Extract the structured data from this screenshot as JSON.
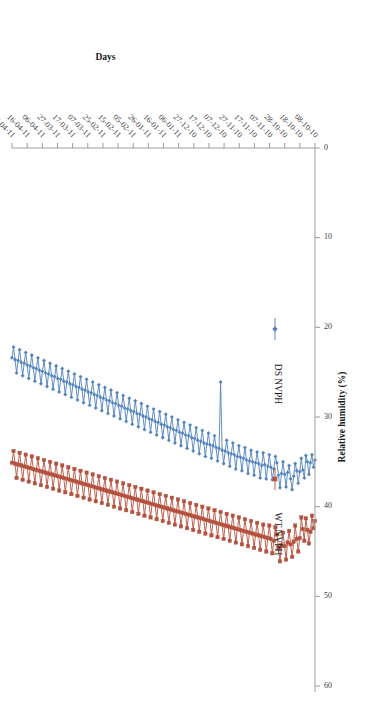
{
  "figure": {
    "orientation_degrees": 180,
    "background_color": "#ffffff"
  },
  "legend": {
    "position": "upper-left",
    "items": [
      {
        "label": "DS NVPH",
        "color": "#4f81bd",
        "marker": "diamond"
      },
      {
        "label": "WT NVPH",
        "color": "#b4503c",
        "marker": "square"
      }
    ]
  },
  "axes": {
    "x": {
      "title": "Days",
      "tick_label_rotation_degrees": 45
    },
    "y": {
      "title": "Relative humidity (%)",
      "ticks": [
        0,
        10,
        20,
        30,
        40,
        50,
        60
      ],
      "min": 0,
      "max": 60
    }
  },
  "chart_data": {
    "type": "line",
    "title": "",
    "xlabel": "Days",
    "ylabel": "Relative humidity (%)",
    "ylim": [
      0,
      60
    ],
    "grid": false,
    "legend_position": "upper-left",
    "tick_labels": [
      "08-10-10",
      "18-10-10",
      "28-10-10",
      "07-11-10",
      "17-11-10",
      "27-11-10",
      "07-12-10",
      "17-12-10",
      "27-12-10",
      "06-01-11",
      "16-01-11",
      "26-01-11",
      "05-02-11",
      "15-02-11",
      "25-02-11",
      "07-03-11",
      "17-03-11",
      "27-03-11",
      "06-04-11",
      "16-04-11",
      "26-04-11"
    ],
    "tick_interval_days": 10,
    "series": [
      {
        "name": "DS NVPH",
        "color": "#4f81bd",
        "marker": "diamond",
        "values": [
          34.8,
          35.6,
          34.2,
          35.1,
          36.4,
          35.0,
          34.3,
          36.8,
          35.9,
          34.6,
          36.1,
          37.4,
          36.0,
          35.2,
          36.6,
          38.1,
          36.9,
          35.4,
          36.2,
          37.8,
          36.4,
          35.0,
          36.3,
          37.9,
          36.5,
          35.1,
          34.4,
          35.8,
          37.0,
          35.6,
          34.2,
          35.5,
          36.9,
          35.3,
          34.0,
          35.4,
          36.8,
          35.2,
          33.9,
          35.1,
          36.5,
          35.0,
          33.7,
          34.9,
          36.3,
          34.8,
          33.4,
          34.6,
          36.0,
          34.5,
          33.2,
          34.4,
          35.8,
          34.2,
          32.9,
          34.1,
          35.5,
          34.0,
          32.6,
          33.8,
          35.2,
          33.7,
          26.1,
          33.5,
          34.9,
          33.4,
          32.1,
          33.2,
          34.6,
          33.1,
          31.8,
          33.0,
          34.4,
          32.9,
          31.5,
          32.7,
          34.1,
          32.6,
          31.2,
          32.4,
          33.8,
          32.3,
          30.9,
          32.1,
          33.5,
          32.0,
          30.6,
          31.8,
          33.2,
          31.7,
          30.3,
          31.5,
          32.9,
          31.4,
          30.0,
          31.2,
          32.6,
          31.1,
          29.7,
          30.9,
          32.3,
          30.8,
          29.4,
          30.6,
          32.0,
          30.5,
          29.1,
          30.3,
          31.7,
          30.2,
          28.8,
          30.0,
          31.4,
          29.9,
          28.5,
          29.7,
          31.1,
          29.6,
          28.2,
          29.4,
          30.8,
          29.3,
          27.9,
          29.1,
          30.5,
          29.0,
          27.6,
          28.8,
          30.2,
          28.7,
          27.3,
          28.5,
          29.9,
          28.4,
          27.0,
          28.2,
          29.6,
          28.1,
          26.7,
          27.9,
          29.3,
          27.8,
          26.4,
          27.6,
          29.0,
          27.5,
          26.1,
          27.3,
          28.7,
          27.2,
          25.8,
          27.0,
          28.4,
          26.9,
          25.5,
          26.7,
          28.1,
          26.6,
          25.2,
          26.4,
          27.8,
          26.3,
          24.9,
          26.1,
          27.5,
          26.0,
          24.6,
          25.8,
          27.2,
          25.7,
          24.3,
          25.5,
          26.9,
          25.4,
          24.0,
          25.2,
          26.6,
          25.1,
          23.7,
          24.9,
          26.3,
          24.8,
          23.4,
          24.6,
          26.0,
          24.5,
          23.1,
          24.3,
          25.7,
          24.2,
          22.8,
          24.0,
          25.4,
          23.9,
          22.5,
          23.7,
          25.1,
          23.6,
          22.2,
          23.4
        ]
      },
      {
        "name": "WT NVPH",
        "color": "#b4503c",
        "marker": "square",
        "values": [
          41.6,
          42.4,
          41.0,
          42.8,
          44.1,
          42.6,
          41.3,
          43.8,
          42.5,
          41.2,
          43.5,
          45.0,
          43.6,
          42.1,
          43.9,
          45.6,
          44.2,
          42.7,
          44.0,
          45.9,
          44.4,
          42.9,
          44.3,
          46.1,
          44.6,
          43.1,
          42.3,
          43.8,
          45.2,
          43.6,
          42.1,
          43.5,
          45.0,
          43.4,
          42.0,
          43.3,
          44.8,
          43.2,
          41.8,
          43.1,
          44.6,
          43.0,
          41.6,
          42.9,
          44.4,
          42.8,
          41.4,
          42.7,
          44.2,
          42.6,
          41.2,
          42.5,
          44.0,
          42.4,
          41.0,
          42.3,
          43.8,
          42.2,
          40.8,
          42.1,
          43.6,
          42.0,
          40.6,
          41.9,
          43.4,
          41.8,
          40.4,
          41.7,
          43.2,
          41.6,
          40.2,
          41.5,
          43.0,
          41.4,
          40.0,
          41.3,
          42.8,
          41.2,
          39.8,
          41.1,
          42.6,
          41.0,
          39.6,
          40.9,
          42.4,
          40.8,
          39.4,
          40.7,
          42.2,
          40.6,
          39.2,
          40.5,
          42.0,
          40.4,
          39.0,
          40.3,
          41.8,
          40.2,
          38.8,
          40.1,
          41.6,
          40.0,
          38.6,
          39.9,
          41.4,
          39.8,
          38.4,
          39.7,
          41.2,
          39.6,
          38.2,
          39.5,
          41.0,
          39.4,
          38.0,
          39.3,
          40.8,
          39.2,
          37.8,
          39.1,
          40.6,
          39.0,
          37.6,
          38.9,
          40.4,
          38.8,
          37.4,
          38.7,
          40.2,
          38.6,
          37.2,
          38.5,
          40.0,
          38.4,
          37.0,
          38.3,
          39.8,
          38.2,
          36.8,
          38.1,
          39.6,
          38.0,
          36.6,
          37.9,
          39.4,
          37.8,
          36.4,
          37.7,
          39.2,
          37.6,
          36.2,
          37.5,
          39.0,
          37.4,
          36.0,
          37.3,
          38.8,
          37.2,
          35.8,
          37.1,
          38.6,
          37.0,
          35.6,
          36.9,
          38.4,
          36.8,
          35.4,
          36.7,
          38.2,
          36.6,
          35.2,
          36.5,
          38.0,
          36.4,
          35.0,
          36.3,
          37.8,
          36.2,
          34.8,
          36.1,
          37.6,
          36.0,
          34.6,
          35.9,
          37.4,
          35.8,
          34.4,
          35.7,
          37.2,
          35.6,
          34.2,
          35.5,
          37.0,
          35.4,
          34.0,
          35.3,
          36.8,
          35.2,
          33.8,
          35.1
        ]
      }
    ]
  }
}
